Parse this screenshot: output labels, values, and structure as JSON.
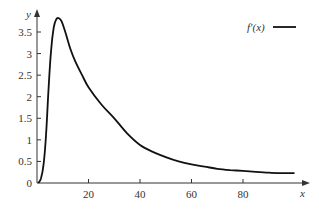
{
  "chart_data": {
    "type": "line",
    "title": "",
    "xlabel": "x",
    "ylabel": "y",
    "xlim": [
      0,
      100
    ],
    "ylim": [
      0,
      3.9
    ],
    "grid": false,
    "legend_position": "top-right",
    "x_ticks": [
      20,
      40,
      60,
      80
    ],
    "x_tick_labels": [
      "20",
      "40",
      "60",
      "80"
    ],
    "y_ticks": [
      0,
      0.5,
      1,
      1.5,
      2,
      2.5,
      3,
      3.5
    ],
    "y_tick_labels": [
      "0",
      "0.5",
      "1",
      "1.5",
      "2",
      "2.5",
      "3",
      "3.5"
    ],
    "series": [
      {
        "name": "f′(x)",
        "color": "#111111",
        "x": [
          0.5,
          1.5,
          2.5,
          3.5,
          4.5,
          5.5,
          6.5,
          7.5,
          8.5,
          9.5,
          11,
          13,
          15,
          17.5,
          20,
          25,
          30,
          35,
          40,
          45,
          50,
          55,
          60,
          65,
          70,
          75,
          80,
          85,
          90,
          95,
          100
        ],
        "y": [
          0.0,
          0.1,
          0.4,
          1.1,
          2.2,
          3.1,
          3.6,
          3.8,
          3.82,
          3.75,
          3.5,
          3.1,
          2.8,
          2.5,
          2.22,
          1.82,
          1.5,
          1.15,
          0.88,
          0.72,
          0.6,
          0.5,
          0.43,
          0.38,
          0.33,
          0.3,
          0.28,
          0.26,
          0.24,
          0.23,
          0.23
        ]
      }
    ]
  },
  "legend": {
    "label": "f′(x)"
  },
  "axes": {
    "x_label": "x",
    "y_label": "y"
  }
}
